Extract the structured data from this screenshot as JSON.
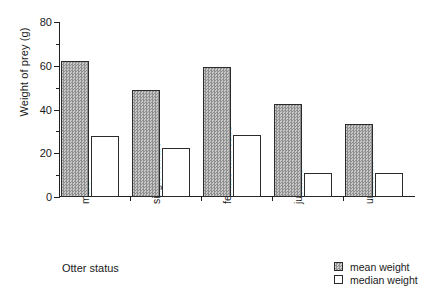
{
  "chart_data": {
    "type": "bar",
    "title": "",
    "xlabel": "Otter status",
    "ylabel": "Weight of prey (g)",
    "categories": [
      "male",
      "single female",
      "female with cubs",
      "juvenile",
      "unknown"
    ],
    "series": [
      {
        "name": "mean weight",
        "values": [
          62,
          49,
          59.5,
          42.5,
          33.5
        ],
        "swatch": "checkered-gray",
        "color": "#a8a8a8"
      },
      {
        "name": "median weight",
        "values": [
          28,
          22.5,
          28.5,
          11,
          11
        ],
        "swatch": "white",
        "color": "#ffffff"
      }
    ],
    "ylim": [
      0,
      80
    ],
    "ytick_major": [
      0,
      20,
      40,
      60,
      80
    ],
    "ytick_minor": [
      10,
      30,
      50,
      70
    ],
    "ytick_labels": [
      "0",
      "20",
      "40",
      "60",
      "80"
    ],
    "grid": false,
    "legend_position": "bottom-right",
    "legend_entries": [
      "mean weight",
      "median weight"
    ],
    "axis_color": "#231f20"
  }
}
